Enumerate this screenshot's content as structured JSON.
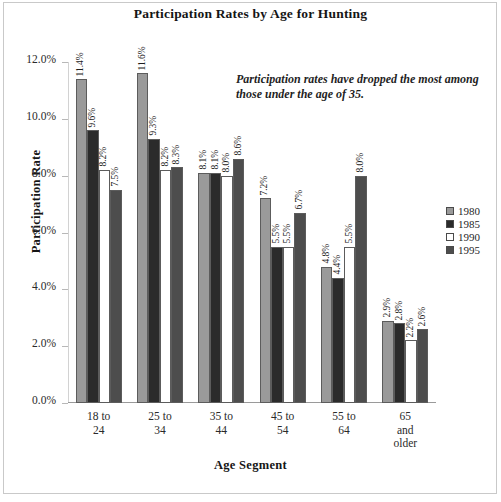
{
  "chart_data": {
    "type": "bar",
    "title": "Participation Rates by Age for Hunting",
    "xlabel": "Age Segment",
    "ylabel": "Participation Rate",
    "categories": [
      "18 to 24",
      "25 to 34",
      "35 to 44",
      "45 to 54",
      "55 to 64",
      "65 and older"
    ],
    "category_lines": [
      [
        "18 to",
        "24"
      ],
      [
        "25 to",
        "34"
      ],
      [
        "35 to",
        "44"
      ],
      [
        "45 to",
        "54"
      ],
      [
        "55 to",
        "64"
      ],
      [
        "65",
        "and",
        "older"
      ]
    ],
    "series": [
      {
        "name": "1980",
        "color": "#9a9a9a",
        "values": [
          11.4,
          11.6,
          8.1,
          7.2,
          4.8,
          2.9
        ],
        "labels": [
          "11.4%",
          "11.6%",
          "8.1%",
          "7.2%",
          "4.8%",
          "2.9%"
        ]
      },
      {
        "name": "1985",
        "color": "#2b2b2b",
        "values": [
          9.6,
          9.3,
          8.1,
          5.5,
          4.4,
          2.8
        ],
        "labels": [
          "9.6%",
          "9.3%",
          "8.1%",
          "5.5%",
          "4.4%",
          "2.8%"
        ]
      },
      {
        "name": "1990",
        "color": "#ffffff",
        "values": [
          8.2,
          8.2,
          8.0,
          5.5,
          5.5,
          2.2
        ],
        "labels": [
          "8.2%",
          "8.2%",
          "8.0%",
          "5.5%",
          "5.5%",
          "2.2%"
        ]
      },
      {
        "name": "1995",
        "color": "#4d4d4d",
        "values": [
          7.5,
          8.3,
          8.6,
          6.7,
          8.0,
          2.6
        ],
        "labels": [
          "7.5%",
          "8.3%",
          "8.6%",
          "6.7%",
          "8.0%",
          "2.6%"
        ]
      }
    ],
    "ylim": [
      0,
      12
    ],
    "ytick_labels": [
      "0.0%",
      "2.0%",
      "4.0%",
      "6.0%",
      "8.0%",
      "10.0%",
      "12.0%"
    ],
    "ytick_values": [
      0,
      2,
      4,
      6,
      8,
      10,
      12
    ],
    "grid": false,
    "legend_position": "right",
    "annotation": "Participation rates have dropped the most among those under the age of 35."
  }
}
